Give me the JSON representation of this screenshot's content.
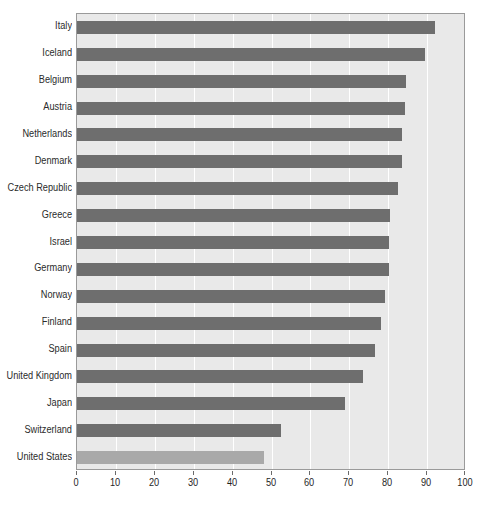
{
  "chart_data": {
    "type": "bar",
    "orientation": "horizontal",
    "title": "",
    "subtitle": "",
    "xlabel": "",
    "ylabel": "",
    "xlim": [
      0,
      100
    ],
    "ylim": null,
    "grid": true,
    "legend": null,
    "legend_position": "none",
    "xticks": [
      0,
      10,
      20,
      30,
      40,
      50,
      60,
      70,
      80,
      90,
      100
    ],
    "xtick_labels": [
      "0",
      "10",
      "20",
      "30",
      "40",
      "50",
      "60",
      "70",
      "80",
      "90",
      "100"
    ],
    "categories": [
      "Italy",
      "Iceland",
      "Belgium",
      "Austria",
      "Netherlands",
      "Denmark",
      "Czech Republic",
      "Greece",
      "Israel",
      "Germany",
      "Norway",
      "Finland",
      "Spain",
      "United Kingdom",
      "Japan",
      "Switzerland",
      "United States"
    ],
    "values": [
      92,
      89.5,
      84.5,
      84.3,
      83.5,
      83.5,
      82.5,
      80.5,
      80.3,
      80.3,
      79.3,
      78.2,
      76.5,
      73.5,
      69,
      52.5,
      48
    ],
    "bar_colors": [
      "#6e6e6e",
      "#6e6e6e",
      "#6e6e6e",
      "#6e6e6e",
      "#6e6e6e",
      "#6e6e6e",
      "#6e6e6e",
      "#6e6e6e",
      "#6e6e6e",
      "#6e6e6e",
      "#6e6e6e",
      "#6e6e6e",
      "#6e6e6e",
      "#6e6e6e",
      "#6e6e6e",
      "#6e6e6e",
      "#a9a9a9"
    ],
    "highlight_category": "United States",
    "plot_background": "#e9e9e9",
    "gridline_color": "#ffffff",
    "frame_color": "#9a9a9a",
    "bar_color": "#6e6e6e",
    "highlight_color": "#a9a9a9"
  }
}
